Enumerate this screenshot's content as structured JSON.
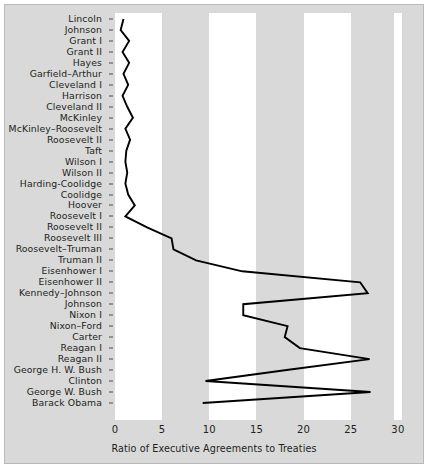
{
  "chart_data": {
    "type": "line",
    "orientation": "horizontal",
    "title": "",
    "xlabel": "Ratio of Executive Agreements to Treaties",
    "ylabel": "",
    "xlim": [
      0,
      30.5
    ],
    "xticks": [
      0,
      5,
      10,
      15,
      20,
      25,
      30
    ],
    "xtick_labels": [
      "0",
      "5",
      "10",
      "15",
      "20",
      "25",
      "30"
    ],
    "grid": "alternating vertical bands, white over 0-5, 10-15, 20-25",
    "legend": "none",
    "categories": [
      "Lincoln",
      "Johnson",
      "Grant I",
      "Grant II",
      "Hayes",
      "Garfield–Arthur",
      "Cleveland I",
      "Harrison",
      "Cleveland II",
      "McKinley",
      "McKinley–Roosevelt",
      "Roosevelt II",
      "Taft",
      "Wilson I",
      "Wilson II",
      "Harding-Coolidge",
      "Coolidge",
      "Hoover",
      "Roosevelt I",
      "Roosevelt II",
      "Roosevelt III",
      "Roosevelt–Truman",
      "Truman II",
      "Eisenhower I",
      "Eisenhower II",
      "Kennedy–Johnson",
      "Johnson",
      "Nixon I",
      "Nixon–Ford",
      "Carter",
      "Reagan I",
      "Reagan II",
      "George H. W. Bush",
      "Clinton",
      "George W. Bush",
      "Barack Obama"
    ],
    "values": [
      0.9,
      0.6,
      1.5,
      0.8,
      1.5,
      0.9,
      1.4,
      0.8,
      1.3,
      1.9,
      1.1,
      1.6,
      1.2,
      1.1,
      1.3,
      1.1,
      1.4,
      2.1,
      1.1,
      3.4,
      6.0,
      6.2,
      8.6,
      13.5,
      26.0,
      26.8,
      13.6,
      13.6,
      18.3,
      18.0,
      19.6,
      27.0,
      18.2,
      9.6,
      27.1,
      9.3
    ],
    "line_color": "#000000",
    "band_color": "#ffffff",
    "background_color": "#d9d9d9"
  },
  "axis": {
    "x_title": "Ratio of Executive Agreements to Treaties"
  }
}
